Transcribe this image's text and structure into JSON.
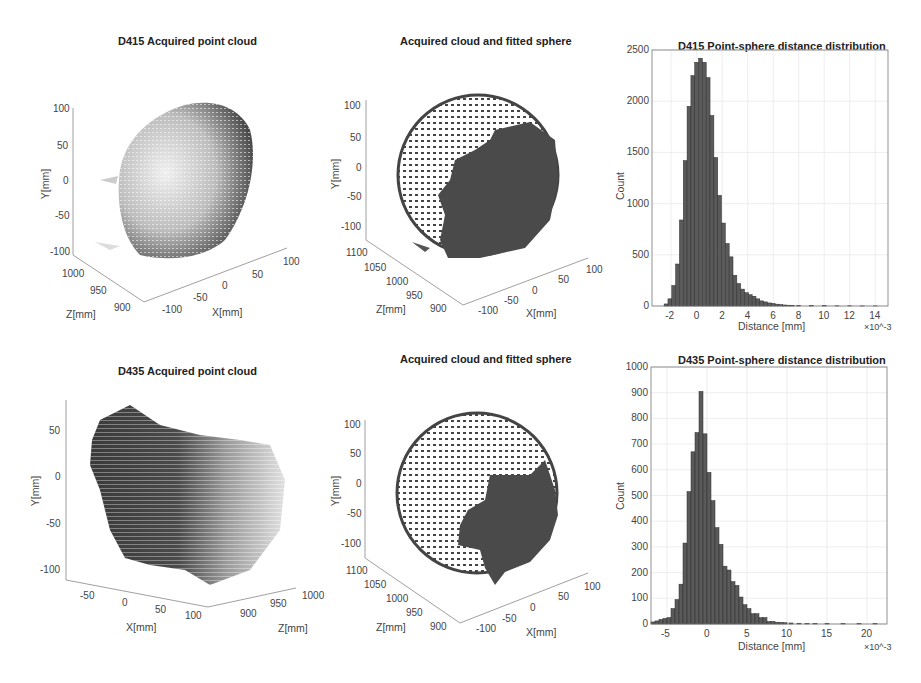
{
  "figure": {
    "panels": [
      {
        "id": "d415-cloud",
        "title": "D415 Acquired point cloud",
        "xlabel": "X[mm]",
        "ylabel": "Y[mm]",
        "zlabel": "Z[mm]",
        "yticks": [
          "100",
          "50",
          "0",
          "-50",
          "-100"
        ],
        "zticks": [
          "1000",
          "950",
          "900"
        ],
        "xticks": [
          "-100",
          "-50",
          "0",
          "50",
          "100"
        ]
      },
      {
        "id": "d415-sphere",
        "title": "Acquired cloud and fitted sphere",
        "xlabel": "X[mm]",
        "ylabel": "Y[mm]",
        "zlabel": "Z[mm]",
        "yticks": [
          "100",
          "50",
          "0",
          "-50",
          "-100"
        ],
        "zticks": [
          "1100",
          "1050",
          "1000",
          "950",
          "900"
        ],
        "xticks": [
          "-100",
          "-50",
          "0",
          "50",
          "100"
        ]
      },
      {
        "id": "d435-cloud",
        "title": "D435 Acquired point cloud",
        "xlabel": "X[mm]",
        "ylabel": "Y[mm]",
        "zlabel": "Z[mm]",
        "yticks": [
          "50",
          "0",
          "-50",
          "-100"
        ],
        "xticks": [
          "-50",
          "0",
          "50",
          "100"
        ],
        "zticks": [
          "900",
          "950",
          "1000"
        ]
      },
      {
        "id": "d435-sphere",
        "title": "Acquired cloud and fitted sphere",
        "xlabel": "X[mm]",
        "ylabel": "Y[mm]",
        "zlabel": "Z[mm]",
        "yticks": [
          "100",
          "50",
          "0",
          "-50",
          "-100"
        ],
        "zticks": [
          "1100",
          "1050",
          "1000",
          "950",
          "900"
        ],
        "xticks": [
          "-100",
          "-50",
          "0",
          "50",
          "100"
        ]
      }
    ]
  },
  "chart_data": [
    {
      "type": "scatter",
      "title": "D415 Acquired point cloud",
      "xlabel": "X[mm]",
      "ylabel": "Y[mm]",
      "zlabel": "Z[mm]",
      "xlim": [
        -100,
        100
      ],
      "ylim": [
        -100,
        100
      ],
      "zlim": [
        900,
        1000
      ],
      "note": "3D point cloud of hemispherical surface, grayscale shaded by depth"
    },
    {
      "type": "scatter",
      "title": "Acquired cloud and fitted sphere",
      "xlabel": "X[mm]",
      "ylabel": "Y[mm]",
      "zlabel": "Z[mm]",
      "xlim": [
        -100,
        100
      ],
      "ylim": [
        -100,
        100
      ],
      "zlim": [
        900,
        1100
      ],
      "note": "Fitted sphere points (sparse) overlaid with dense acquired D415 cloud (right side)"
    },
    {
      "type": "bar",
      "title": "D415 Point-sphere distance distribution",
      "xlabel": "Distance [mm]",
      "ylabel": "Count",
      "x_multiplier": "×10^-3",
      "xticks": [
        -2,
        0,
        2,
        4,
        6,
        8,
        10,
        12,
        14
      ],
      "yticks": [
        0,
        500,
        1000,
        1500,
        2000,
        2500
      ],
      "xlim": [
        -3.5,
        15
      ],
      "ylim": [
        0,
        2500
      ],
      "grid": true,
      "bin_width": 0.3,
      "x": [
        -2.4,
        -2.1,
        -1.8,
        -1.5,
        -1.2,
        -0.9,
        -0.6,
        -0.3,
        0.0,
        0.3,
        0.6,
        0.9,
        1.2,
        1.5,
        1.8,
        2.1,
        2.4,
        2.7,
        3.0,
        3.3,
        3.6,
        3.9,
        4.2,
        4.5,
        4.8,
        5.1,
        5.4,
        5.7,
        6.0,
        6.3,
        6.6,
        6.9,
        7.2,
        7.5,
        8.0,
        9.0,
        10.0,
        11.0,
        12.0,
        13.0,
        14.0
      ],
      "values": [
        20,
        70,
        200,
        410,
        840,
        1420,
        1950,
        2250,
        2380,
        2420,
        2380,
        2230,
        1860,
        1450,
        1080,
        810,
        610,
        480,
        300,
        220,
        165,
        130,
        110,
        95,
        70,
        50,
        40,
        30,
        25,
        18,
        14,
        10,
        8,
        6,
        5,
        4,
        3,
        2,
        2,
        1,
        1
      ]
    },
    {
      "type": "scatter",
      "title": "D435 Acquired point cloud",
      "xlabel": "X[mm]",
      "ylabel": "Y[mm]",
      "zlabel": "Z[mm]",
      "xlim": [
        -50,
        100
      ],
      "ylim": [
        -100,
        50
      ],
      "zlim": [
        900,
        1000
      ],
      "note": "3D point cloud, grayscale shaded by depth"
    },
    {
      "type": "scatter",
      "title": "Acquired cloud and fitted sphere",
      "xlabel": "X[mm]",
      "ylabel": "Y[mm]",
      "zlabel": "Z[mm]",
      "xlim": [
        -100,
        100
      ],
      "ylim": [
        -100,
        100
      ],
      "zlim": [
        900,
        1100
      ],
      "note": "Fitted sphere points (sparse) overlaid with dense acquired D435 cloud (lower right)"
    },
    {
      "type": "bar",
      "title": "D435 Point-sphere distance distribution",
      "xlabel": "Distance [mm]",
      "ylabel": "Count",
      "x_multiplier": "×10^-3",
      "xticks": [
        -5,
        0,
        5,
        10,
        15,
        20
      ],
      "yticks": [
        0,
        100,
        200,
        300,
        400,
        500,
        600,
        700,
        800,
        900,
        1000
      ],
      "xlim": [
        -7,
        22.5
      ],
      "ylim": [
        0,
        1000
      ],
      "grid": true,
      "bin_width": 0.5,
      "x": [
        -6.75,
        -6.25,
        -5.75,
        -5.25,
        -4.75,
        -4.25,
        -3.75,
        -3.25,
        -2.75,
        -2.25,
        -1.75,
        -1.25,
        -0.75,
        -0.25,
        0.25,
        0.75,
        1.25,
        1.75,
        2.25,
        2.75,
        3.25,
        3.75,
        4.25,
        4.75,
        5.25,
        5.75,
        6.25,
        6.75,
        7.25,
        7.75,
        8.25,
        8.75,
        9.25,
        9.75,
        10.5,
        11.5,
        12.5,
        13.5,
        15,
        17,
        19,
        21
      ],
      "values": [
        8,
        12,
        18,
        22,
        25,
        60,
        95,
        155,
        315,
        515,
        670,
        745,
        905,
        740,
        590,
        480,
        375,
        310,
        225,
        210,
        165,
        150,
        105,
        75,
        60,
        40,
        40,
        25,
        25,
        10,
        10,
        7,
        6,
        5,
        4,
        3,
        2,
        2,
        1,
        1,
        1,
        1
      ]
    }
  ]
}
